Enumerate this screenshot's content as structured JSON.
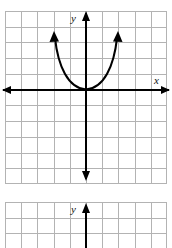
{
  "page": {
    "background_color": "#ffffff",
    "width": 172,
    "height": 248
  },
  "style": {
    "grid_line_color": "#b3b3b3",
    "grid_border_color": "#9a9a9a",
    "axis_color": "#000000",
    "curve_color": "#000000",
    "label_color": "#111111"
  },
  "graphs": [
    {
      "id": "graph-top",
      "name": "parabola-graph",
      "x": 5,
      "y": 11,
      "width": 162,
      "height": 173,
      "grid": {
        "columns": 10,
        "rows": 11,
        "cell_width": 16.2,
        "cell_height": 15.73,
        "visible": true
      },
      "axes": {
        "x_axis": {
          "label": "x",
          "label_x": 157,
          "label_y": 78,
          "y_position": 90,
          "arrow_left": true,
          "arrow_right": true
        },
        "y_axis": {
          "label": "y",
          "label_x": 74,
          "label_y": 17,
          "x_position": 86,
          "arrow_up": true,
          "arrow_down": true
        },
        "origin": {
          "x": 86,
          "y": 90
        }
      },
      "curve": {
        "type": "parabola",
        "orientation": "opens-up",
        "vertex": {
          "x": 86,
          "y": 90
        },
        "vertex_units": {
          "x": 0,
          "y": 0
        },
        "equation": "y = x^2",
        "left_endpoint": {
          "x": 53,
          "y": 33
        },
        "right_endpoint": {
          "x": 119,
          "y": 33
        },
        "arrow_left_branch": true,
        "arrow_right_branch": true
      }
    },
    {
      "id": "graph-bottom",
      "name": "empty-graph",
      "x": 5,
      "y": 202,
      "width": 162,
      "height": 46,
      "grid": {
        "columns": 10,
        "rows": 3,
        "cell_width": 16.2,
        "cell_height": 15.73,
        "visible": true
      },
      "axes": {
        "y_axis": {
          "label": "y",
          "label_x": 74,
          "label_y": 208,
          "x_position": 86,
          "arrow_up": true,
          "arrow_down": false
        }
      },
      "curve": null
    }
  ]
}
